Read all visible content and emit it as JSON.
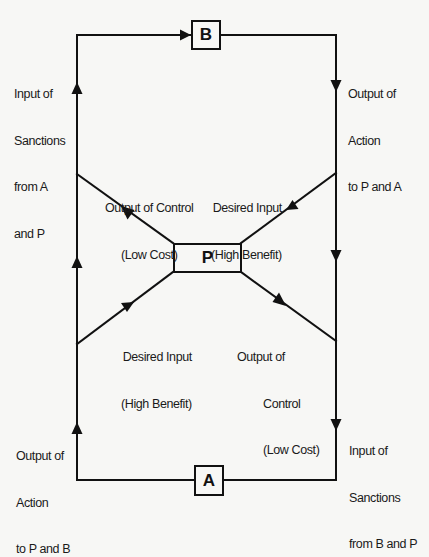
{
  "title_partial": "STAKEHOLDERS",
  "nodes": {
    "B": {
      "label": "B"
    },
    "P": {
      "label": "P"
    },
    "A": {
      "label": "A"
    }
  },
  "labels": {
    "left_top": {
      "lines": [
        "Input of",
        "Sanctions",
        "from A",
        "and P"
      ]
    },
    "right_top": {
      "lines": [
        "Output of",
        "Action",
        "to P and A"
      ]
    },
    "upper_left_diag": {
      "lines": [
        "Output of Control",
        "(Low Cost)"
      ]
    },
    "upper_right_diag": {
      "lines": [
        "Desired Input",
        "(High Benefit)"
      ]
    },
    "lower_left_diag": {
      "lines": [
        "Desired Input",
        "(High Benefit)"
      ]
    },
    "lower_right_diag": {
      "lines": [
        "Output of",
        "Control",
        "(Low Cost)"
      ]
    },
    "left_bottom": {
      "lines": [
        "Output of",
        "Action",
        "to P and B"
      ]
    },
    "right_bottom": {
      "lines": [
        "Input of",
        "Sanctions",
        "from B and P"
      ]
    }
  },
  "colors": {
    "line": "#111111",
    "background": "#f7f7f5"
  }
}
